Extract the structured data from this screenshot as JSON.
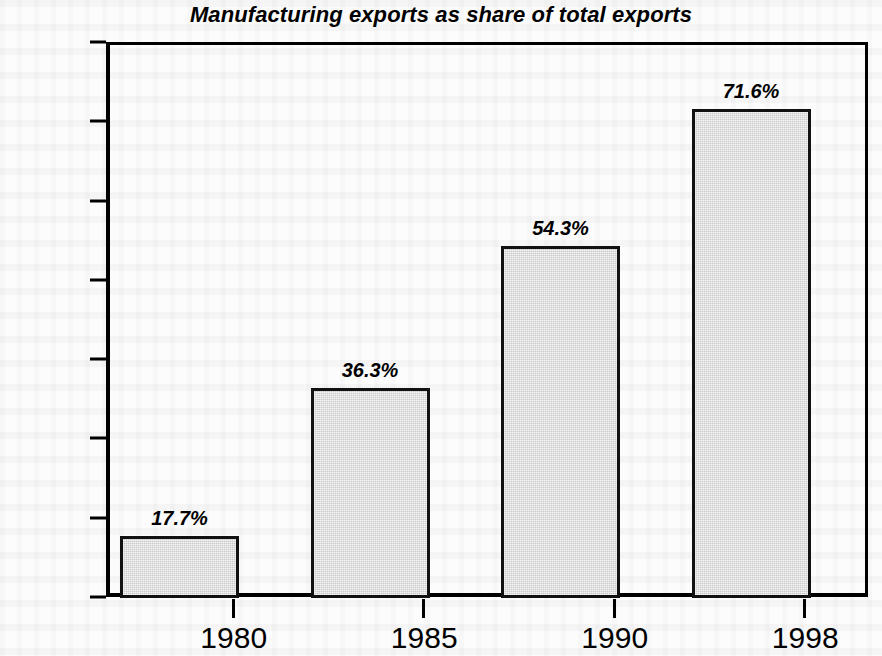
{
  "chart_data": {
    "type": "bar",
    "title": "Manufacturing exports as share of total exports",
    "xlabel": "",
    "ylabel": "percentages",
    "categories": [
      "1980",
      "1985",
      "1990",
      "1998"
    ],
    "values": [
      17.7,
      36.3,
      54.3,
      71.6
    ],
    "value_labels": [
      "17.7%",
      "36.3%",
      "54.3%",
      "71.6%"
    ],
    "ylim": [
      10,
      80
    ],
    "y_ticks": [
      80,
      70,
      60,
      50,
      40,
      30,
      20,
      10
    ],
    "y_tick_labels": [
      "80",
      "70",
      "60",
      "50",
      "40",
      "30",
      "20",
      "10"
    ],
    "grid": false,
    "legend": null,
    "bar_fill_color": "#c9c9c9",
    "bar_border_color": "#111111",
    "background_color": "#fcfcfc",
    "text_color": "#000000"
  }
}
